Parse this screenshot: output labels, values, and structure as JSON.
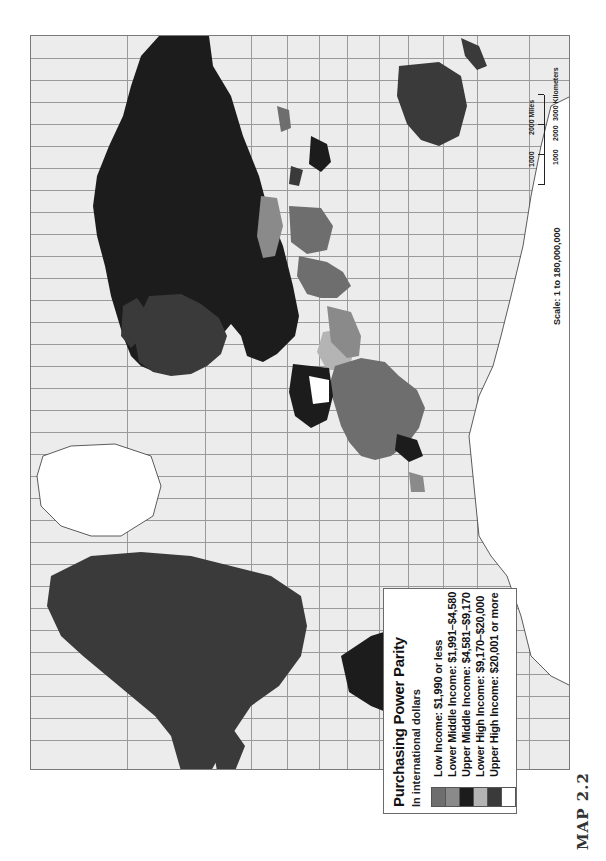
{
  "figure": {
    "label": "MAP 2.2",
    "orientation": "rotated 90° counter-clockwise (north faces left)",
    "background_color": "#ececec",
    "grid_color": "#9a9a9a"
  },
  "legend": {
    "title": "Purchasing Power Parity",
    "subtitle": "In international dollars",
    "items": [
      {
        "label": "Low Income: $1,990 or less",
        "color": "#6e6e6e"
      },
      {
        "label": "Lower Middle Income: $1,991–$4,580",
        "color": "#8a8a8a"
      },
      {
        "label": "Upper Middle Income: $4,581–$9,170",
        "color": "#1c1c1c"
      },
      {
        "label": "Lower High Income: $9,170–$20,000",
        "color": "#b4b4b4"
      },
      {
        "label": "Upper High Income: $20,001 or more",
        "color": "#3a3a3a"
      },
      {
        "label": "",
        "color": "#ffffff"
      }
    ]
  },
  "scale": {
    "text": "Scale: 1 to 180,000,000",
    "miles_ticks": [
      "1000",
      "2000 Miles"
    ],
    "km_ticks": [
      "1000",
      "2000",
      "3000 Kilometers"
    ]
  },
  "regions": [
    {
      "name": "North America (USA/Canada)",
      "class": "Upper High Income",
      "color": "#3a3a3a"
    },
    {
      "name": "Greenland",
      "class": "no data",
      "color": "#ffffff"
    },
    {
      "name": "Russia / Northern Asia",
      "class": "Upper Middle Income",
      "color": "#1c1c1c"
    },
    {
      "name": "South America (southern cone)",
      "class": "Lower High Income",
      "color": "#b4b4b4"
    },
    {
      "name": "Brazil / northern South America",
      "class": "Upper Middle Income",
      "color": "#1c1c1c"
    },
    {
      "name": "Australia",
      "class": "Upper High Income",
      "color": "#3a3a3a"
    },
    {
      "name": "Africa (sub-Saharan)",
      "class": "Low / Lower Middle Income",
      "color": "#6e6e6e"
    },
    {
      "name": "Europe",
      "class": "Upper High Income",
      "color": "#3a3a3a"
    },
    {
      "name": "India / South Asia",
      "class": "Low Income",
      "color": "#6e6e6e"
    },
    {
      "name": "Mongolia",
      "class": "Lower Middle Income",
      "color": "#8a8a8a"
    }
  ]
}
